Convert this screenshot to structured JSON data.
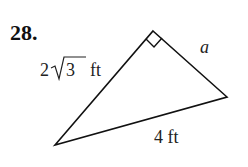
{
  "problem": {
    "number": "28.",
    "labels": {
      "leg_left": {
        "coef": "2",
        "radicand": "3",
        "unit": "ft"
      },
      "leg_right": "a",
      "hypotenuse": "4 ft"
    },
    "triangle": {
      "vertices": {
        "right_angle": [
          153,
          31
        ],
        "right": [
          227,
          97
        ],
        "bottom_left": [
          55,
          145
        ]
      },
      "right_angle_marker": true
    }
  }
}
